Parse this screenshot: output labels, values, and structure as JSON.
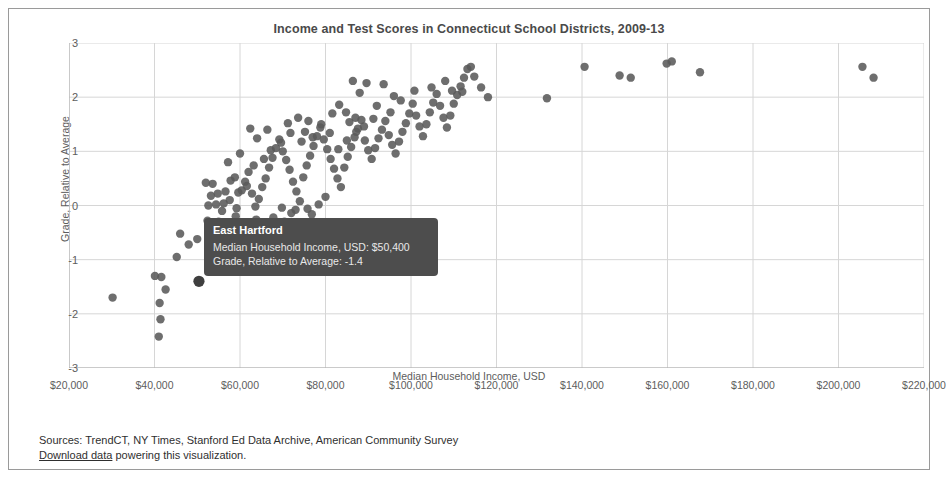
{
  "chart_data": {
    "type": "scatter",
    "title": "Income and Test Scores in Connecticut School Districts, 2009-13",
    "xlabel": "Median Household Income, USD",
    "ylabel": "Grade, Relative to Average",
    "xlim": [
      20000,
      220000
    ],
    "ylim": [
      -3,
      3
    ],
    "grid": true,
    "legend": "none",
    "marker_color": "#5a5a5a",
    "xticks": [
      20000,
      40000,
      60000,
      80000,
      100000,
      120000,
      140000,
      160000,
      180000,
      200000,
      220000
    ],
    "xticklabels": [
      "$20,000",
      "$40,000",
      "$60,000",
      "$80,000",
      "$100,000",
      "$120,000",
      "$140,000",
      "$160,000",
      "$180,000",
      "$200,000",
      "$220,000"
    ],
    "yticks": [
      3,
      2,
      1,
      0,
      -1,
      -2,
      -3
    ],
    "yticklabels": [
      "3",
      "2",
      "1",
      "0",
      "-1",
      "-2",
      "-3"
    ],
    "points": [
      [
        30200,
        -1.7
      ],
      [
        40100,
        -1.3
      ],
      [
        41600,
        -1.32
      ],
      [
        42600,
        -1.55
      ],
      [
        41200,
        -1.8
      ],
      [
        41400,
        -2.1
      ],
      [
        41000,
        -2.42
      ],
      [
        46000,
        -0.52
      ],
      [
        48000,
        -0.72
      ],
      [
        45200,
        -0.95
      ],
      [
        50400,
        -1.4
      ],
      [
        50000,
        -0.62
      ],
      [
        52400,
        -0.28
      ],
      [
        53200,
        0.18
      ],
      [
        52600,
        0.0
      ],
      [
        54400,
        0.02
      ],
      [
        56200,
        0.04
      ],
      [
        57600,
        0.1
      ],
      [
        55000,
        -0.3
      ],
      [
        58400,
        -0.36
      ],
      [
        59200,
        -0.05
      ],
      [
        60400,
        0.28
      ],
      [
        61200,
        0.44
      ],
      [
        62000,
        0.62
      ],
      [
        58800,
        0.52
      ],
      [
        57200,
        0.8
      ],
      [
        60000,
        0.96
      ],
      [
        62800,
        0.22
      ],
      [
        63600,
        -0.02
      ],
      [
        64400,
        0.12
      ],
      [
        65200,
        0.34
      ],
      [
        66000,
        0.5
      ],
      [
        66800,
        0.7
      ],
      [
        67600,
        0.88
      ],
      [
        68400,
        1.06
      ],
      [
        64000,
        1.24
      ],
      [
        62400,
        1.42
      ],
      [
        66400,
        1.4
      ],
      [
        69200,
        1.22
      ],
      [
        70000,
        1.0
      ],
      [
        70800,
        0.84
      ],
      [
        71600,
        0.66
      ],
      [
        72400,
        0.44
      ],
      [
        73200,
        0.26
      ],
      [
        74000,
        0.08
      ],
      [
        72000,
        -0.14
      ],
      [
        70400,
        -0.3
      ],
      [
        68000,
        -0.48
      ],
      [
        66600,
        -0.62
      ],
      [
        74800,
        0.52
      ],
      [
        75600,
        0.74
      ],
      [
        76400,
        0.92
      ],
      [
        77200,
        1.1
      ],
      [
        78000,
        1.28
      ],
      [
        78800,
        1.44
      ],
      [
        76000,
        1.56
      ],
      [
        73600,
        1.62
      ],
      [
        71200,
        1.52
      ],
      [
        75200,
        1.36
      ],
      [
        79600,
        1.22
      ],
      [
        80400,
        1.04
      ],
      [
        81200,
        0.86
      ],
      [
        82000,
        0.68
      ],
      [
        82800,
        0.5
      ],
      [
        83600,
        0.34
      ],
      [
        80000,
        0.16
      ],
      [
        78400,
        0.02
      ],
      [
        76800,
        -0.16
      ],
      [
        84400,
        0.7
      ],
      [
        85200,
        0.9
      ],
      [
        86000,
        1.08
      ],
      [
        86800,
        1.26
      ],
      [
        87600,
        1.42
      ],
      [
        88400,
        1.58
      ],
      [
        84800,
        1.72
      ],
      [
        83200,
        1.86
      ],
      [
        81600,
        1.7
      ],
      [
        85600,
        1.54
      ],
      [
        87200,
        1.36
      ],
      [
        89200,
        1.2
      ],
      [
        90000,
        1.02
      ],
      [
        90800,
        0.86
      ],
      [
        91600,
        1.06
      ],
      [
        92400,
        1.24
      ],
      [
        93200,
        1.4
      ],
      [
        94000,
        1.56
      ],
      [
        94800,
        1.3
      ],
      [
        95600,
        1.12
      ],
      [
        96400,
        0.96
      ],
      [
        97200,
        1.18
      ],
      [
        98000,
        1.36
      ],
      [
        98800,
        1.52
      ],
      [
        99600,
        1.7
      ],
      [
        92000,
        1.84
      ],
      [
        88000,
        2.08
      ],
      [
        86400,
        2.3
      ],
      [
        89600,
        2.26
      ],
      [
        93600,
        2.24
      ],
      [
        96000,
        2.02
      ],
      [
        100400,
        1.88
      ],
      [
        101200,
        1.66
      ],
      [
        102000,
        1.46
      ],
      [
        102800,
        1.28
      ],
      [
        103600,
        1.5
      ],
      [
        104400,
        1.72
      ],
      [
        105200,
        1.9
      ],
      [
        106000,
        2.06
      ],
      [
        106800,
        1.84
      ],
      [
        107600,
        1.62
      ],
      [
        108400,
        1.44
      ],
      [
        109200,
        1.66
      ],
      [
        110000,
        1.88
      ],
      [
        110800,
        2.04
      ],
      [
        111600,
        2.2
      ],
      [
        112400,
        2.36
      ],
      [
        113200,
        2.52
      ],
      [
        114000,
        2.56
      ],
      [
        114800,
        2.38
      ],
      [
        109600,
        2.12
      ],
      [
        104800,
        2.18
      ],
      [
        100800,
        2.12
      ],
      [
        97600,
        1.94
      ],
      [
        95200,
        1.72
      ],
      [
        91200,
        1.6
      ],
      [
        89000,
        1.46
      ],
      [
        87000,
        1.62
      ],
      [
        85000,
        1.2
      ],
      [
        83000,
        1.04
      ],
      [
        81000,
        1.34
      ],
      [
        79000,
        1.5
      ],
      [
        77000,
        1.26
      ],
      [
        74400,
        1.18
      ],
      [
        71800,
        1.34
      ],
      [
        69600,
        1.16
      ],
      [
        67200,
        1.02
      ],
      [
        65600,
        0.86
      ],
      [
        63200,
        0.74
      ],
      [
        61600,
        0.36
      ],
      [
        59600,
        0.24
      ],
      [
        57800,
        0.46
      ],
      [
        56600,
        0.26
      ],
      [
        54800,
        0.22
      ],
      [
        53600,
        0.4
      ],
      [
        52000,
        0.42
      ],
      [
        55800,
        -0.1
      ],
      [
        59000,
        -0.2
      ],
      [
        63800,
        -0.26
      ],
      [
        67800,
        -0.22
      ],
      [
        69800,
        -0.04
      ],
      [
        73000,
        -0.08
      ],
      [
        75800,
        -0.06
      ],
      [
        64800,
        -0.38
      ],
      [
        61000,
        -0.48
      ],
      [
        58000,
        -0.58
      ],
      [
        55400,
        -0.72
      ],
      [
        53000,
        -0.88
      ],
      [
        56800,
        -0.86
      ],
      [
        60600,
        -0.64
      ],
      [
        65000,
        -0.74
      ],
      [
        70600,
        -0.52
      ],
      [
        72800,
        -0.4
      ],
      [
        118000,
        2.0
      ],
      [
        131800,
        1.98
      ],
      [
        140600,
        2.56
      ],
      [
        148800,
        2.4
      ],
      [
        151400,
        2.36
      ],
      [
        159800,
        2.62
      ],
      [
        161000,
        2.66
      ],
      [
        167600,
        2.46
      ],
      [
        205600,
        2.56
      ],
      [
        208200,
        2.36
      ],
      [
        116400,
        2.18
      ],
      [
        112000,
        2.1
      ],
      [
        108000,
        2.3
      ]
    ],
    "highlight_point": {
      "x": 50400,
      "y": -1.4,
      "name": "East Hartford"
    }
  },
  "tooltip": {
    "title": "East Hartford",
    "rows": [
      "Median Household Income, USD: $50,400",
      "Grade, Relative to Average: -1.4"
    ]
  },
  "footer": {
    "sources": "Sources: TrendCT, NY Times, Stanford Ed Data Archive, American Community Survey",
    "download_link": "Download data",
    "download_rest": " powering this visualization."
  }
}
